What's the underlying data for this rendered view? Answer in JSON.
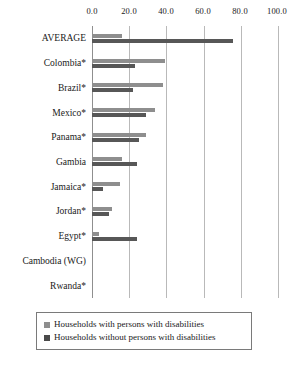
{
  "chart_data": {
    "type": "bar",
    "orientation": "horizontal",
    "title": "",
    "xlabel": "",
    "ylabel": "",
    "xlim": [
      0,
      100
    ],
    "xticks": [
      "0.0",
      "20.0",
      "40.0",
      "60.0",
      "80.0",
      "100.0"
    ],
    "xtick_values": [
      0,
      20,
      40,
      60,
      80,
      100
    ],
    "grid": true,
    "legend_position": "bottom",
    "categories": [
      "AVERAGE",
      "Colombia*",
      "Brazil*",
      "Mexico*",
      "Panama*",
      "Gambia",
      "Jamaica*",
      "Jordan*",
      "Egypt*",
      "Cambodia (WG)",
      "Rwanda*"
    ],
    "series": [
      {
        "name": "Households with persons with disabilities",
        "color": "#8e8e8e",
        "values": [
          16,
          39,
          38,
          34,
          29,
          16,
          15,
          11,
          4,
          0,
          0
        ]
      },
      {
        "name": "Households without persons with disabilities",
        "color": "#575757",
        "values": [
          76,
          23,
          22,
          29,
          25,
          24,
          6,
          9,
          24,
          0,
          0
        ]
      }
    ]
  },
  "legend": {
    "items": [
      {
        "label": "Households with persons with disabilities",
        "swatch": "light"
      },
      {
        "label": "Households without persons with disabilities",
        "swatch": "dark"
      }
    ]
  }
}
